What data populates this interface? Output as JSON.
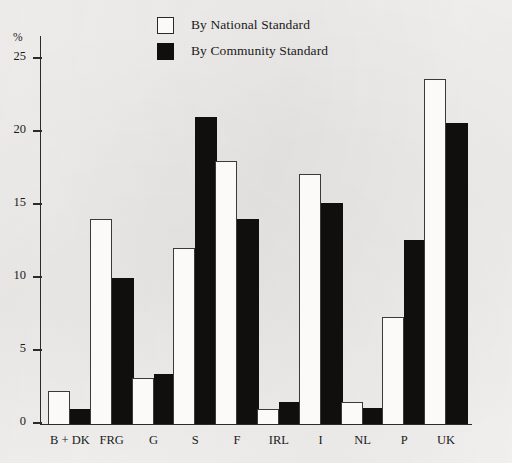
{
  "chart_data": {
    "type": "bar",
    "title": "",
    "xlabel": "",
    "ylabel": "%",
    "ylim": [
      0,
      26.5
    ],
    "yticks": [
      0,
      5,
      10,
      15,
      20,
      25
    ],
    "grid": false,
    "legend_position": "top-center",
    "categories": [
      "B + DK",
      "FRG",
      "G",
      "S",
      "F",
      "IRL",
      "I",
      "NL",
      "P",
      "UK"
    ],
    "series": [
      {
        "name": "By National Standard",
        "color": "#fbfaf8",
        "values": [
          2.2,
          14.0,
          3.1,
          12.0,
          18.0,
          1.0,
          17.1,
          1.5,
          7.3,
          23.6
        ]
      },
      {
        "name": "By Community Standard",
        "color": "#100f0e",
        "values": [
          1.0,
          10.0,
          3.4,
          21.0,
          14.0,
          1.5,
          15.1,
          1.1,
          12.6,
          20.6
        ]
      }
    ]
  },
  "legend": {
    "items": [
      {
        "label": "By National Standard",
        "swatch": "white-square-outline"
      },
      {
        "label": "By Community Standard",
        "swatch": "black-square"
      }
    ]
  },
  "axes": {
    "y_unit": "%",
    "y_tick_labels": [
      "25",
      "20",
      "15",
      "10",
      "5",
      "0"
    ],
    "x_tick_labels": [
      "B + DK",
      "FRG",
      "G",
      "S",
      "F",
      "IRL",
      "I",
      "NL",
      "P",
      "UK"
    ]
  }
}
